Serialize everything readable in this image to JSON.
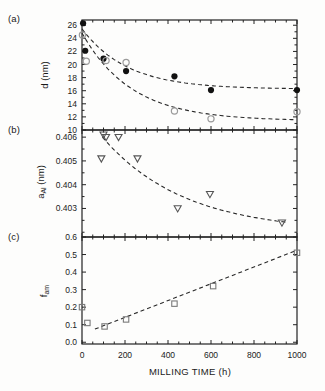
{
  "figure": {
    "panel_labels": [
      "(a)",
      "(b)",
      "(c)"
    ],
    "background": "#fdfdfc",
    "axis_color": "#222222",
    "curve_color": "#2a2a2a"
  },
  "x_axis": {
    "label": "MILLING TIME (h)",
    "lim": [
      0,
      1000
    ],
    "ticks": [
      0,
      200,
      400,
      600,
      800,
      1000
    ],
    "tick_labels": [
      "0",
      "200",
      "400",
      "600",
      "800",
      "1000"
    ],
    "minor": [
      50,
      100,
      150,
      250,
      300,
      350,
      450,
      500,
      550,
      650,
      700,
      750,
      850,
      900,
      950
    ]
  },
  "chart_data": [
    {
      "panel": "a",
      "type": "scatter",
      "ylabel": "d (nm)",
      "ylabel_main": "d",
      "ylabel_sub": "",
      "ylabel_unit": " (nm)",
      "ylim": [
        10,
        26.8
      ],
      "yticks": [
        26,
        24,
        22,
        20,
        18,
        16,
        14,
        12,
        10
      ],
      "ytick_labels": [
        "26",
        "24",
        "22",
        "20",
        "18",
        "16",
        "14",
        "12",
        "10"
      ],
      "yminor": [
        25,
        23,
        21,
        19,
        17,
        15,
        13,
        11
      ],
      "series": [
        {
          "name": "filled-circles",
          "marker": "circle-filled",
          "color": "#111111",
          "points": [
            [
              5,
              26.3
            ],
            [
              15,
              22.1
            ],
            [
              100,
              20.9
            ],
            [
              205,
              19.0
            ],
            [
              430,
              18.2
            ],
            [
              600,
              16.1
            ],
            [
              1000,
              16.1
            ]
          ]
        },
        {
          "name": "open-circles",
          "marker": "circle-open",
          "color": "#9b9b9b",
          "points": [
            [
              2,
              24.5
            ],
            [
              20,
              20.5
            ],
            [
              112,
              20.6
            ],
            [
              205,
              20.3
            ],
            [
              430,
              12.9
            ],
            [
              600,
              11.7
            ],
            [
              1000,
              12.8
            ]
          ]
        }
      ],
      "curves": [
        {
          "type": "exp",
          "plateau": 16.25,
          "amplitude": 9.2,
          "tau": 210,
          "x_start": 0,
          "x_end": 1000
        },
        {
          "type": "exp",
          "plateau": 11.4,
          "amplitude": 13.4,
          "tau": 230,
          "x_start": 0,
          "x_end": 1000
        }
      ]
    },
    {
      "panel": "b",
      "type": "scatter",
      "ylabel": "a_Al (nm)",
      "ylabel_main": "a",
      "ylabel_sub": "Al",
      "ylabel_unit": " (nm)",
      "ylim": [
        0.4018,
        0.4063
      ],
      "yticks": [
        0.406,
        0.405,
        0.404,
        0.403
      ],
      "ytick_labels": [
        "0.406",
        "0.405",
        "0.404",
        "0.403"
      ],
      "yminor": [
        0.4055,
        0.4045,
        0.4035,
        0.4025,
        0.402
      ],
      "series": [
        {
          "name": "open-triangles",
          "marker": "triangle-open",
          "color": "#555555",
          "points": [
            [
              90,
              0.4051
            ],
            [
              100,
              0.4061
            ],
            [
              112,
              0.406
            ],
            [
              170,
              0.406
            ],
            [
              258,
              0.4051
            ],
            [
              445,
              0.403
            ],
            [
              595,
              0.4036
            ],
            [
              930,
              0.4024
            ]
          ]
        }
      ],
      "curves": [
        {
          "type": "exp",
          "plateau": 0.402,
          "amplitude": 0.004,
          "tau": 380,
          "x_start": 95,
          "x_end": 950
        }
      ]
    },
    {
      "panel": "c",
      "type": "scatter",
      "ylabel": "f_am",
      "ylabel_main": "f",
      "ylabel_sub": "am",
      "ylabel_unit": "",
      "ylim": [
        -0.01,
        0.6
      ],
      "yticks": [
        0.6,
        0.5,
        0.4,
        0.3,
        0.2,
        0.1,
        0.0
      ],
      "ytick_labels": [
        "0.6",
        "0.5",
        "0.4",
        "0.3",
        "0.2",
        "0.1",
        "0.0"
      ],
      "yminor": [],
      "series": [
        {
          "name": "open-squares",
          "marker": "square-open",
          "color": "#7a7a7a",
          "points": [
            [
              0,
              0.2
            ],
            [
              25,
              0.11
            ],
            [
              105,
              0.09
            ],
            [
              205,
              0.13
            ],
            [
              430,
              0.22
            ],
            [
              610,
              0.32
            ],
            [
              1000,
              0.51
            ]
          ]
        }
      ],
      "curves": [
        {
          "type": "linear",
          "x_start": 60,
          "y_start": 0.075,
          "x_end": 1000,
          "y_end": 0.525
        }
      ]
    }
  ]
}
